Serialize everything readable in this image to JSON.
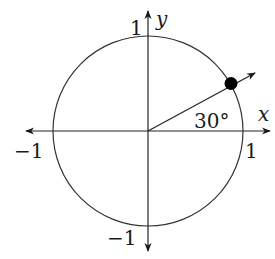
{
  "diagram": {
    "type": "unit-circle",
    "center": {
      "x": 148,
      "y": 131
    },
    "radius": 95,
    "angle_deg": 30,
    "angle_label": "30°",
    "axes": {
      "x_label": "x",
      "y_label": "y",
      "x_pos_tick": "1",
      "x_neg_tick": "−1",
      "y_pos_tick": "1",
      "y_neg_tick": "−1"
    },
    "point": {
      "label": "terminal point at 30°",
      "filled": true
    },
    "colors": {
      "stroke": "#2a2a2a",
      "point": "#000000",
      "background": "#ffffff"
    }
  }
}
